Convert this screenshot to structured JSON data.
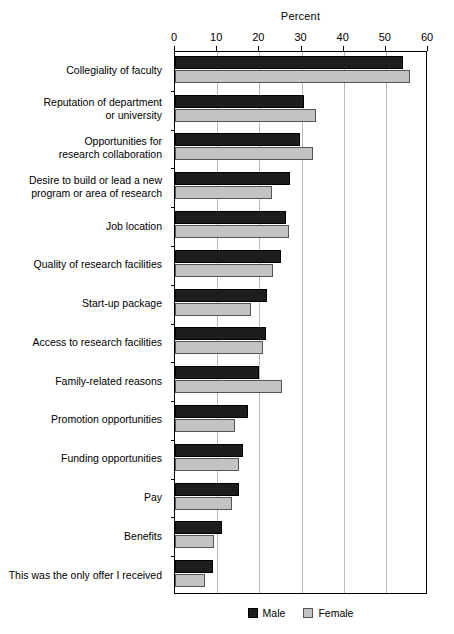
{
  "chart_data": {
    "type": "bar",
    "orientation": "horizontal",
    "title": "",
    "xlabel": "Percent",
    "ylabel": "",
    "xlim": [
      0,
      60
    ],
    "xticks": [
      0,
      10,
      20,
      30,
      40,
      50,
      60
    ],
    "grid": true,
    "legend_position": "bottom",
    "categories": [
      "Collegiality of faculty",
      "Reputation of department\nor university",
      "Opportunities for\nresearch collaboration",
      "Desire to build or lead a new\nprogram or area of research",
      "Job location",
      "Quality of research facilities",
      "Start-up package",
      "Access to research facilities",
      "Family-related reasons",
      "Promotion opportunities",
      "Funding opportunities",
      "Pay",
      "Benefits",
      "This was the only offer I received"
    ],
    "series": [
      {
        "name": "Male",
        "color": "#1d1d1d",
        "values": [
          54.0,
          30.5,
          29.6,
          27.2,
          26.3,
          25.1,
          21.8,
          21.5,
          19.9,
          17.3,
          16.1,
          15.2,
          11.2,
          9.0
        ]
      },
      {
        "name": "Female",
        "color": "#c3c3c3",
        "values": [
          55.7,
          33.4,
          32.7,
          23.0,
          27.0,
          23.2,
          18.0,
          20.8,
          25.3,
          14.2,
          15.2,
          13.5,
          9.2,
          7.1
        ]
      }
    ]
  },
  "legend": {
    "items": [
      {
        "label": "Male",
        "swatch": "male-swatch"
      },
      {
        "label": "Female",
        "swatch": "female-swatch"
      }
    ]
  }
}
